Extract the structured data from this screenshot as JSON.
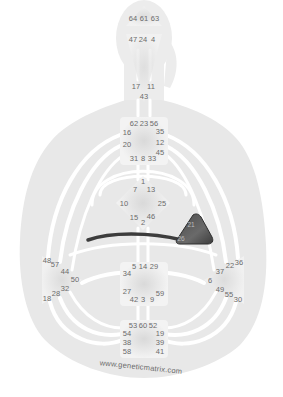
{
  "chart": {
    "watermark": "www.geneticmatrix.com",
    "colors": {
      "body_fill": "#e9e9e9",
      "channel_white": "#ffffff",
      "center_fill": "#f1f1f1",
      "defined_center": "#5a5a5a",
      "defined_channel": "#3c3c3c",
      "gate_text": "#6b6b6b",
      "background": "#ffffff"
    },
    "centers": {
      "head": {
        "gates": [
          "64",
          "61",
          "63"
        ]
      },
      "ajna": {
        "gates": [
          "47",
          "24",
          "4",
          "17",
          "11",
          "43"
        ]
      },
      "throat": {
        "gates": [
          "62",
          "23",
          "56",
          "16",
          "35",
          "20",
          "12",
          "45",
          "31",
          "8",
          "33"
        ]
      },
      "g": {
        "gates": [
          "1",
          "7",
          "13",
          "10",
          "25",
          "15",
          "2",
          "46"
        ]
      },
      "heart": {
        "gates": [
          "21",
          "40",
          "26",
          "51"
        ],
        "defined": true
      },
      "spleen": {
        "gates": [
          "48",
          "57",
          "44",
          "50",
          "32",
          "28",
          "18"
        ]
      },
      "solar_plexus": {
        "gates": [
          "36",
          "22",
          "37",
          "6",
          "49",
          "55",
          "30"
        ]
      },
      "sacral": {
        "gates": [
          "5",
          "14",
          "29",
          "34",
          "27",
          "59",
          "42",
          "3",
          "9"
        ]
      },
      "root": {
        "gates": [
          "53",
          "60",
          "52",
          "54",
          "19",
          "38",
          "39",
          "58",
          "41"
        ]
      }
    },
    "defined_channels": [
      {
        "name": "heart-to-spleen-arc",
        "from": "heart",
        "to": "spleen"
      }
    ],
    "labels": [
      {
        "id": "g64",
        "text": "64",
        "x": 133,
        "y": 19
      },
      {
        "id": "g61",
        "text": "61",
        "x": 144,
        "y": 19
      },
      {
        "id": "g63",
        "text": "63",
        "x": 155,
        "y": 19
      },
      {
        "id": "g47",
        "text": "47",
        "x": 133,
        "y": 40
      },
      {
        "id": "g24",
        "text": "24",
        "x": 143,
        "y": 40
      },
      {
        "id": "g4",
        "text": "4",
        "x": 153,
        "y": 40
      },
      {
        "id": "g17",
        "text": "17",
        "x": 136,
        "y": 87
      },
      {
        "id": "g11",
        "text": "11",
        "x": 151,
        "y": 87
      },
      {
        "id": "g43",
        "text": "43",
        "x": 144,
        "y": 97
      },
      {
        "id": "g62",
        "text": "62",
        "x": 134,
        "y": 124
      },
      {
        "id": "g23",
        "text": "23",
        "x": 144,
        "y": 124
      },
      {
        "id": "g56",
        "text": "56",
        "x": 154,
        "y": 124
      },
      {
        "id": "g16",
        "text": "16",
        "x": 127,
        "y": 133
      },
      {
        "id": "g35",
        "text": "35",
        "x": 160,
        "y": 132
      },
      {
        "id": "g20",
        "text": "20",
        "x": 127,
        "y": 145
      },
      {
        "id": "g12",
        "text": "12",
        "x": 160,
        "y": 143
      },
      {
        "id": "g45",
        "text": "45",
        "x": 160,
        "y": 153
      },
      {
        "id": "g31",
        "text": "31",
        "x": 134,
        "y": 159
      },
      {
        "id": "g8",
        "text": "8",
        "x": 143,
        "y": 159
      },
      {
        "id": "g33",
        "text": "33",
        "x": 152,
        "y": 159
      },
      {
        "id": "g1",
        "text": "1",
        "x": 143,
        "y": 182
      },
      {
        "id": "g7",
        "text": "7",
        "x": 135,
        "y": 190
      },
      {
        "id": "g13",
        "text": "13",
        "x": 151,
        "y": 190
      },
      {
        "id": "g10",
        "text": "10",
        "x": 124,
        "y": 204
      },
      {
        "id": "g25",
        "text": "25",
        "x": 162,
        "y": 204
      },
      {
        "id": "g15",
        "text": "15",
        "x": 134,
        "y": 218
      },
      {
        "id": "g46",
        "text": "46",
        "x": 151,
        "y": 217
      },
      {
        "id": "g2",
        "text": "2",
        "x": 143,
        "y": 223
      },
      {
        "id": "g21",
        "text": "21",
        "x": 191,
        "y": 225
      },
      {
        "id": "g26",
        "text": "26",
        "x": 181,
        "y": 239
      },
      {
        "id": "g48",
        "text": "48",
        "x": 47,
        "y": 261
      },
      {
        "id": "g57",
        "text": "57",
        "x": 55,
        "y": 265
      },
      {
        "id": "g44",
        "text": "44",
        "x": 65,
        "y": 272
      },
      {
        "id": "g50",
        "text": "50",
        "x": 75,
        "y": 280
      },
      {
        "id": "g32",
        "text": "32",
        "x": 65,
        "y": 289
      },
      {
        "id": "g28",
        "text": "28",
        "x": 56,
        "y": 294
      },
      {
        "id": "g18",
        "text": "18",
        "x": 47,
        "y": 299
      },
      {
        "id": "g5",
        "text": "5",
        "x": 134,
        "y": 267
      },
      {
        "id": "g14",
        "text": "14",
        "x": 143,
        "y": 267
      },
      {
        "id": "g29",
        "text": "29",
        "x": 154,
        "y": 267
      },
      {
        "id": "g34",
        "text": "34",
        "x": 127,
        "y": 274
      },
      {
        "id": "g27",
        "text": "27",
        "x": 127,
        "y": 292
      },
      {
        "id": "g59",
        "text": "59",
        "x": 160,
        "y": 294
      },
      {
        "id": "g42",
        "text": "42",
        "x": 134,
        "y": 300
      },
      {
        "id": "g3",
        "text": "3",
        "x": 143,
        "y": 300
      },
      {
        "id": "g9",
        "text": "9",
        "x": 152,
        "y": 300
      },
      {
        "id": "g36",
        "text": "36",
        "x": 239,
        "y": 263
      },
      {
        "id": "g22",
        "text": "22",
        "x": 230,
        "y": 266
      },
      {
        "id": "g37",
        "text": "37",
        "x": 220,
        "y": 272
      },
      {
        "id": "g6",
        "text": "6",
        "x": 210,
        "y": 281
      },
      {
        "id": "g49",
        "text": "49",
        "x": 220,
        "y": 290
      },
      {
        "id": "g55",
        "text": "55",
        "x": 229,
        "y": 295
      },
      {
        "id": "g30",
        "text": "30",
        "x": 238,
        "y": 300
      },
      {
        "id": "g53",
        "text": "53",
        "x": 133,
        "y": 326
      },
      {
        "id": "g60",
        "text": "60",
        "x": 143,
        "y": 326
      },
      {
        "id": "g52",
        "text": "52",
        "x": 153,
        "y": 326
      },
      {
        "id": "g54",
        "text": "54",
        "x": 127,
        "y": 334
      },
      {
        "id": "g19",
        "text": "19",
        "x": 160,
        "y": 334
      },
      {
        "id": "g38",
        "text": "38",
        "x": 127,
        "y": 343
      },
      {
        "id": "g39",
        "text": "39",
        "x": 160,
        "y": 343
      },
      {
        "id": "g58",
        "text": "58",
        "x": 127,
        "y": 352
      },
      {
        "id": "g41",
        "text": "41",
        "x": 160,
        "y": 352
      }
    ]
  }
}
